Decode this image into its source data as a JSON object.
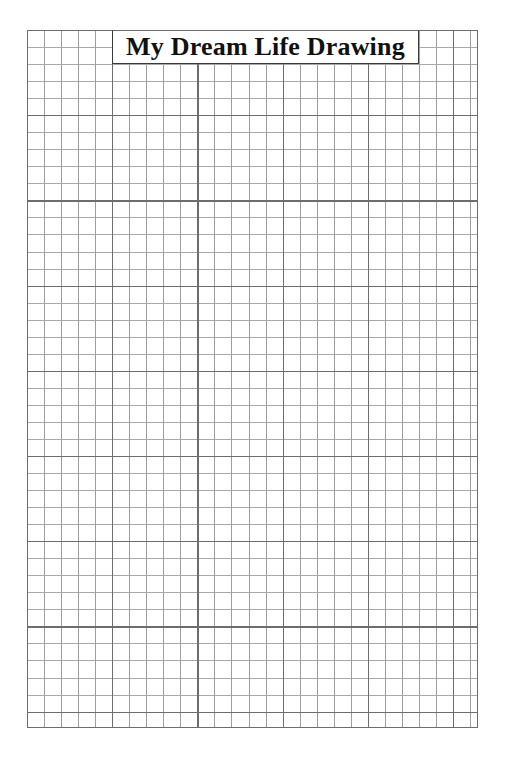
{
  "page": {
    "background_color": "#ffffff",
    "width": 505,
    "height": 759
  },
  "title_box": {
    "text": "My Dream Life Drawing",
    "border_color": "#3a3a3a",
    "background_color": "#ffffff"
  },
  "grid": {
    "name": "graph-paper-grid",
    "cell_size_px": 17,
    "columns": 26,
    "rows": 41,
    "major_line_every": 5,
    "minor_line_color": "#9e9e9e",
    "major_line_color": "#6d6d6d",
    "border_color": "#6d6d6d",
    "fill_color": "#ffffff"
  }
}
